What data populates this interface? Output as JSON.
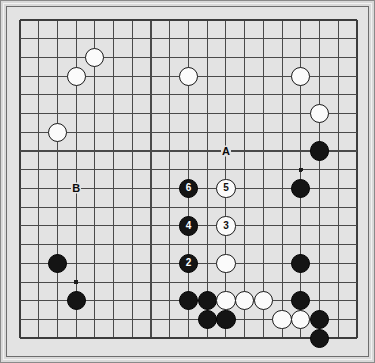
{
  "diagram": {
    "board": {
      "columns": 19,
      "rows": 18,
      "origin_x": 11,
      "origin_y": 11,
      "spacing": 18.72,
      "line_color": "#4a4a4a",
      "edge_color": "#3c3c3c",
      "background_color": "#e3e3e3",
      "frame_color": "#6d6d6d",
      "page_background": "#d9d9d9"
    },
    "star_points": [
      {
        "col": 3,
        "row": 14
      },
      {
        "col": 15,
        "row": 8
      }
    ],
    "stones": [
      {
        "id": "w-c4-r2",
        "color": "white",
        "col": 4,
        "row": 2,
        "label": ""
      },
      {
        "id": "w-c3-r3",
        "color": "white",
        "col": 3,
        "row": 3,
        "label": ""
      },
      {
        "id": "w-c9-r3",
        "color": "white",
        "col": 9,
        "row": 3,
        "label": ""
      },
      {
        "id": "w-c15-r3",
        "color": "white",
        "col": 15,
        "row": 3,
        "label": ""
      },
      {
        "id": "w-c16-r5",
        "color": "white",
        "col": 16,
        "row": 5,
        "label": ""
      },
      {
        "id": "w-c2-r6",
        "color": "white",
        "col": 2,
        "row": 6,
        "label": ""
      },
      {
        "id": "b-c16-r7",
        "color": "black",
        "col": 16,
        "row": 7,
        "label": ""
      },
      {
        "id": "b-c9-r9",
        "color": "black",
        "col": 9,
        "row": 9,
        "label": "6"
      },
      {
        "id": "w-c11-r9",
        "color": "white",
        "col": 11,
        "row": 9,
        "label": "5"
      },
      {
        "id": "b-c15-r9",
        "color": "black",
        "col": 15,
        "row": 9,
        "label": ""
      },
      {
        "id": "b-c9-r11",
        "color": "black",
        "col": 9,
        "row": 11,
        "label": "4"
      },
      {
        "id": "w-c11-r11",
        "color": "white",
        "col": 11,
        "row": 11,
        "label": "3"
      },
      {
        "id": "b-c2-r13",
        "color": "black",
        "col": 2,
        "row": 13,
        "label": ""
      },
      {
        "id": "b-c9-r13",
        "color": "black",
        "col": 9,
        "row": 13,
        "label": "2"
      },
      {
        "id": "w-c11-r13",
        "color": "white",
        "col": 11,
        "row": 13,
        "label": ""
      },
      {
        "id": "b-c15-r13",
        "color": "black",
        "col": 15,
        "row": 13,
        "label": ""
      },
      {
        "id": "b-c3-r15",
        "color": "black",
        "col": 3,
        "row": 15,
        "label": ""
      },
      {
        "id": "b-c9-r15",
        "color": "black",
        "col": 9,
        "row": 15,
        "label": ""
      },
      {
        "id": "b-c10-r15",
        "color": "black",
        "col": 10,
        "row": 15,
        "label": ""
      },
      {
        "id": "w-c11-r15",
        "color": "white",
        "col": 11,
        "row": 15,
        "label": ""
      },
      {
        "id": "w-c12-r15",
        "color": "white",
        "col": 12,
        "row": 15,
        "label": ""
      },
      {
        "id": "w-c13-r15",
        "color": "white",
        "col": 13,
        "row": 15,
        "label": ""
      },
      {
        "id": "b-c15-r15",
        "color": "black",
        "col": 15,
        "row": 15,
        "label": ""
      },
      {
        "id": "b-c10-r16",
        "color": "black",
        "col": 10,
        "row": 16,
        "label": ""
      },
      {
        "id": "b-c11-r16",
        "color": "black",
        "col": 11,
        "row": 16,
        "label": ""
      },
      {
        "id": "w-c14-r16",
        "color": "white",
        "col": 14,
        "row": 16,
        "label": ""
      },
      {
        "id": "w-c15-r16",
        "color": "white",
        "col": 15,
        "row": 16,
        "label": ""
      },
      {
        "id": "b-c16-r16",
        "color": "black",
        "col": 16,
        "row": 16,
        "label": ""
      },
      {
        "id": "b-c16-r17",
        "color": "black",
        "col": 16,
        "row": 17,
        "label": ""
      }
    ],
    "point_markers": [
      {
        "id": "marker-a",
        "label": "A",
        "col": 11,
        "row": 7
      },
      {
        "id": "marker-b",
        "label": "B",
        "col": 3,
        "row": 9
      }
    ]
  }
}
